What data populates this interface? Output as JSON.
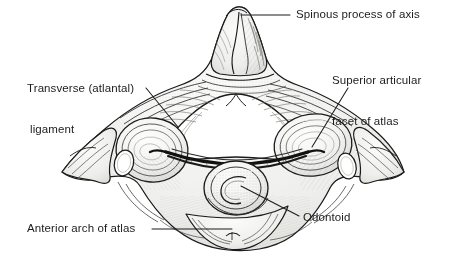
{
  "figure": {
    "style": "black-and-white pen-and-ink line drawing with stipple and cross-hatch shading",
    "background_color": "#ffffff",
    "ink_color": "#1a1a1a",
    "shade_color": "#e8e8e6",
    "label_color": "#1c1c1c",
    "ligament_color": "#111111"
  },
  "labels": {
    "spinous": {
      "text": "Spinous process of axis",
      "lines": [
        "Spinous process of axis"
      ],
      "leader": "horizontal line from the left of the text to the notched tip of the spinous process"
    },
    "transverse": {
      "text": "Transverse (atlantal) ligament",
      "lines": [
        "Transverse (atlantal)",
        "ligament"
      ],
      "leader": "diagonal line running down and to the right to the dark transverse ligament band"
    },
    "superior": {
      "text": "Superior articular facet of atlas",
      "lines": [
        "Superior articular",
        "facet of atlas"
      ],
      "leader": "diagonal line running down and to the left to the right superior articular facet"
    },
    "odontoid": {
      "text": "Odontoid",
      "lines": [
        "Odontoid"
      ],
      "leader": "diagonal line running up and to the left to the odontoid process"
    },
    "anterior": {
      "text": "Anterior arch of atlas",
      "lines": [
        "Anterior arch of atlas"
      ],
      "leader": "horizontal line from the right of the text to the anterior arch at the bottom centre"
    }
  },
  "structures": [
    {
      "name": "spinous-process-of-axis",
      "position": "top centre",
      "note": "bifid, notched tip"
    },
    {
      "name": "vertebral-foramen",
      "position": "centre",
      "note": "large heart-shaped opening, unshaded white"
    },
    {
      "name": "transverse-atlantal-ligament",
      "position": "centre, below the foramen",
      "note": "thick dark horizontal band arching across behind the odontoid"
    },
    {
      "name": "odontoid-process",
      "position": "lower centre",
      "note": "rounded dens with a C-shaped internal marking"
    },
    {
      "name": "superior-articular-facet-of-atlas-right",
      "position": "right of centre",
      "note": "large oval concave facet"
    },
    {
      "name": "superior-articular-facet-of-atlas-left",
      "position": "left of centre",
      "note": "large oval concave facet"
    },
    {
      "name": "transverse-foramen-left",
      "position": "left lateral mass",
      "note": "small oval hole"
    },
    {
      "name": "transverse-foramen-right",
      "position": "right lateral mass",
      "note": "small oval hole"
    },
    {
      "name": "transverse-process-left",
      "position": "far left",
      "note": "wing-like lateral projection"
    },
    {
      "name": "transverse-process-right",
      "position": "far right",
      "note": "wing-like lateral projection"
    },
    {
      "name": "anterior-arch-of-atlas",
      "position": "bottom centre",
      "note": "rounded anterior lobe"
    }
  ]
}
